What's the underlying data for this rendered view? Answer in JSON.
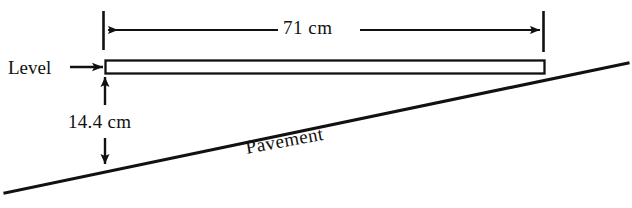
{
  "diagram": {
    "background_color": "#ffffff",
    "line_color": "#111111",
    "labels": {
      "level": "Level",
      "span": "71 cm",
      "height": "14.4 cm",
      "pavement": "Pavement"
    },
    "measurements": {
      "horizontal_span_cm": 71,
      "vertical_drop_cm": 14.4
    },
    "geometry": {
      "level_bar": {
        "x": 105,
        "y": 60,
        "width": 440,
        "height": 14
      },
      "pavement_line": {
        "x1": 5,
        "y1": 193,
        "x2": 628,
        "y2": 63
      },
      "span_dimension": {
        "left_tick_x": 103,
        "right_tick_x": 543,
        "line_y": 30,
        "tick_top": 11,
        "tick_bottom": 50
      },
      "height_dimension": {
        "x": 105,
        "top_y": 76,
        "bottom_y": 164
      },
      "level_pointer": {
        "x1": 70,
        "x2": 103,
        "y": 67
      }
    }
  }
}
